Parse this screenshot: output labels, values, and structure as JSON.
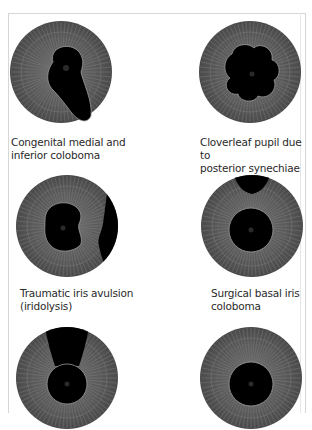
{
  "figure": {
    "panels": [
      {
        "id": "p1",
        "shape": "keyhole-inferonasal",
        "caption_lines": [
          "Congenital medial and",
          "inferior coloboma"
        ]
      },
      {
        "id": "p2",
        "shape": "cloverleaf",
        "caption_lines": [
          "Cloverleaf pupil due to",
          "posterior synechiae"
        ]
      },
      {
        "id": "p3",
        "shape": "avulsion-right",
        "caption_lines": [
          "Traumatic iris avulsion",
          "(iridolysis)"
        ]
      },
      {
        "id": "p4",
        "shape": "basal-superior",
        "caption_lines": [
          "Surgical basal iris",
          "coloboma"
        ]
      },
      {
        "id": "p5",
        "shape": "keyhole-superior",
        "caption_lines": []
      },
      {
        "id": "p6",
        "shape": "round",
        "caption_lines": []
      }
    ],
    "colors": {
      "iris": "#5a5a5a",
      "iris_fiber": "#8a8a8a",
      "pupil": "#000000",
      "border": "#d6d6d6"
    }
  }
}
